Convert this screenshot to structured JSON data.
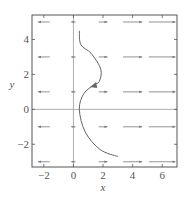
{
  "chart_data": {
    "type": "line",
    "title": "",
    "xlabel": "x",
    "ylabel": "y",
    "xlim": [
      -2.8,
      7
    ],
    "ylim": [
      -3.3,
      5.4
    ],
    "xticks": [
      -2,
      0,
      2,
      4,
      6
    ],
    "yticks": [
      -2,
      0,
      2,
      4
    ],
    "xtick_labels": [
      "−2",
      "0",
      "2",
      "4",
      "6"
    ],
    "ytick_labels": [
      "−2",
      "0",
      "2",
      "4"
    ],
    "grid": false,
    "direction_field": {
      "rows_y": [
        5,
        3,
        1,
        -1,
        -3
      ],
      "arrows": [
        {
          "x": -2,
          "dir": "left",
          "len": 0.8
        },
        {
          "x": 0,
          "dir": "left",
          "len": 0.3
        },
        {
          "x": 2,
          "dir": "right",
          "len": 0.6
        },
        {
          "x": 4,
          "dir": "right",
          "len": 1.3
        },
        {
          "x": 6,
          "dir": "right",
          "len": 1.8
        }
      ]
    },
    "series": [
      {
        "name": "trajectory",
        "points": [
          [
            0.4,
            4.5
          ],
          [
            0.5,
            3.7
          ],
          [
            1.2,
            3.2
          ],
          [
            1.85,
            2.3
          ],
          [
            1.75,
            1.6
          ],
          [
            1.4,
            1.4
          ],
          [
            0.7,
            0.9
          ],
          [
            0.4,
            0.0
          ],
          [
            0.8,
            -1.3
          ],
          [
            1.8,
            -2.3
          ],
          [
            3.0,
            -2.7
          ]
        ],
        "direction_marker": {
          "x": 1.4,
          "y": 1.4,
          "pointing": "down-left"
        }
      }
    ],
    "axis_lines": {
      "x_axis_at_y": 0,
      "y_axis_at_x": 0
    }
  },
  "colors": {
    "frame": "#555555",
    "curve": "#666666",
    "arrows": "#777777",
    "axis_lines": "#999999",
    "text": "#555555"
  }
}
